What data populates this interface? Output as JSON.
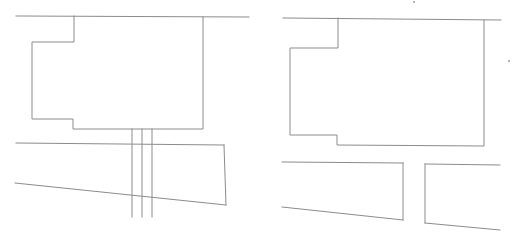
{
  "diagram": {
    "width": 513,
    "height": 241,
    "background": "#ffffff",
    "line_color": "#8c8c8c",
    "panels": [
      {
        "name": "left-panel",
        "road_edge": [
          [
            16,
            16
          ],
          [
            249,
            17
          ]
        ],
        "building_outline": [
          [
            74,
            16
          ],
          [
            74,
            42
          ],
          [
            32,
            42
          ],
          [
            32,
            119
          ],
          [
            73,
            119
          ],
          [
            73,
            129
          ],
          [
            203,
            129
          ],
          [
            203,
            17
          ]
        ],
        "lower_lot": {
          "top": [
            [
              16,
              143
            ],
            [
              224,
              145
            ]
          ],
          "right": [
            [
              224,
              145
            ],
            [
              226,
              205
            ]
          ],
          "bottom": [
            [
              15,
              183
            ],
            [
              226,
              205
            ]
          ]
        },
        "passage_lines": [
          [
            [
              132,
              129
            ],
            [
              132,
              217
            ]
          ],
          [
            [
              142,
              129
            ],
            [
              142,
              217
            ]
          ],
          [
            [
              152,
              129
            ],
            [
              152,
              217
            ]
          ]
        ]
      },
      {
        "name": "right-panel",
        "road_edge": [
          [
            283,
            18
          ],
          [
            501,
            20
          ]
        ],
        "building_outline": [
          [
            338,
            18
          ],
          [
            338,
            48
          ],
          [
            290,
            48
          ],
          [
            290,
            135
          ],
          [
            337,
            135
          ],
          [
            337,
            145
          ],
          [
            484,
            146
          ],
          [
            484,
            20
          ]
        ],
        "lower_lot_left": {
          "top": [
            [
              282,
              162
            ],
            [
              403,
              163
            ]
          ],
          "right": [
            [
              403,
              163
            ],
            [
              403,
              220
            ]
          ],
          "bottom": [
            [
              282,
              207
            ],
            [
              403,
              220
            ]
          ]
        },
        "lower_lot_right": {
          "top": [
            [
              425,
              164
            ],
            [
              500,
              165
            ]
          ],
          "left": [
            [
              425,
              164
            ],
            [
              425,
              223
            ]
          ],
          "bottom": [
            [
              425,
              223
            ],
            [
              500,
              230
            ]
          ]
        }
      }
    ],
    "specks": [
      [
        414,
        2
      ],
      [
        509,
        61
      ]
    ]
  }
}
